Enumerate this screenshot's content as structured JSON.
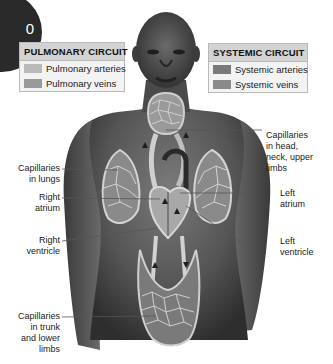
{
  "figure": {
    "type": "anatomical-diagram",
    "corner_badge_text": "0"
  },
  "legends": {
    "pulmonary": {
      "title": "PULMONARY CIRCUIT",
      "items": [
        {
          "label": "Pulmonary arteries",
          "color": "#b9b9b9"
        },
        {
          "label": "Pulmonary veins",
          "color": "#9a9a9a"
        }
      ]
    },
    "systemic": {
      "title": "SYSTEMIC CIRCUIT",
      "items": [
        {
          "label": "Systemic arteries",
          "color": "#7a7a7a"
        },
        {
          "label": "Systemic veins",
          "color": "#8a8a8a"
        }
      ]
    }
  },
  "labels": {
    "capillaries_lungs": "Capillaries in lungs",
    "right_atrium": "Right atrium",
    "right_ventricle": "Right ventricle",
    "capillaries_trunk": "Capillaries in trunk and lower limbs",
    "capillaries_head": "Capillaries in head, neck, upper limbs",
    "left_atrium": "Left atrium",
    "left_ventricle": "Left ventricle"
  },
  "label_lines": {
    "capillaries_lungs": [
      "Capillaries",
      "in lungs"
    ],
    "right_atrium": [
      "Right",
      "atrium"
    ],
    "right_ventricle": [
      "Right",
      "ventricle"
    ],
    "capillaries_trunk": [
      "Capillaries",
      "in trunk",
      "and lower",
      "limbs"
    ],
    "capillaries_head": [
      "Capillaries",
      "in head,",
      "neck, upper",
      "limbs"
    ],
    "left_atrium": [
      "Left",
      "atrium"
    ],
    "left_ventricle": [
      "Left",
      "ventricle"
    ]
  },
  "colors": {
    "skin_dark": "#3c3c3c",
    "skin_mid": "#6a6a6a",
    "vessel_light": "#c8c8c8",
    "background": "#ffffff"
  }
}
